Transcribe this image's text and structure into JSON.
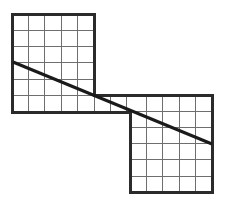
{
  "figure": {
    "type": "geometry-diagram",
    "canvas": {
      "width": 226,
      "height": 206,
      "background": "#ffffff"
    },
    "style": {
      "outline_color": "#2b2b2b",
      "outline_width": 3,
      "grid_color": "#6e6e6e",
      "grid_width": 1,
      "diagonal_color": "#1a1a1a",
      "diagonal_width": 3,
      "fill_color": "#ffffff"
    },
    "cell_size": 16.4,
    "squares": [
      {
        "name": "upper-left-square",
        "x": 12,
        "y": 14,
        "columns": 5,
        "rows": 6,
        "width": 82,
        "height": 98
      },
      {
        "name": "lower-right-square",
        "x": 130,
        "y": 95,
        "columns": 5,
        "rows": 6,
        "width": 82,
        "height": 97
      }
    ],
    "connector_band": {
      "name": "lower-left-band",
      "x": 12,
      "y": 95,
      "width": 118,
      "height": 17,
      "columns": 7,
      "rows": 1
    },
    "outline_path": "M 12 14 L 94 14 L 94 95 L 212 95 L 212 192 L 130 192 L 130 112 L 12 112 Z",
    "diagonal": {
      "name": "diagonal-line",
      "x1": 13,
      "y1": 62,
      "x2": 212,
      "y2": 144,
      "label": ""
    },
    "left_grid_vlines": [
      28.4,
      44.8,
      61.2,
      77.6
    ],
    "left_grid_hlines": [
      30.3,
      46.6,
      62.9,
      79.2,
      95.5
    ],
    "band_vlines": [
      94,
      110.4,
      126.8
    ],
    "right_grid_vlines": [
      146.4,
      162.8,
      179.2,
      195.6
    ],
    "right_grid_hlines": [
      111.2,
      127.4,
      143.6,
      159.8,
      176.0
    ]
  }
}
